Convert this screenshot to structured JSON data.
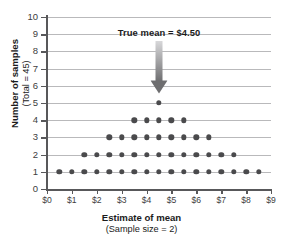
{
  "chart_data": {
    "type": "scatter",
    "title": "",
    "xlabel": "Estimate of mean",
    "xlabel_sub": "(Sample size = 2)",
    "ylabel": "Number of samples",
    "ylabel_sub": "(Total = 45)",
    "xlim": [
      0,
      9
    ],
    "ylim": [
      0,
      10
    ],
    "grid": true,
    "legend": "none",
    "x_tick_labels": [
      "$0",
      "$1",
      "$2",
      "$3",
      "$4",
      "$5",
      "$6",
      "$7",
      "$8",
      "$9"
    ],
    "x_tick_values": [
      0,
      1,
      2,
      3,
      4,
      5,
      6,
      7,
      8,
      9
    ],
    "y_tick_labels": [
      "0",
      "1",
      "2",
      "3",
      "4",
      "5",
      "6",
      "7",
      "8",
      "9",
      "10"
    ],
    "y_tick_values": [
      0,
      1,
      2,
      3,
      4,
      5,
      6,
      7,
      8,
      9,
      10
    ],
    "dot_spacing": 0.5,
    "total_samples": 45,
    "columns": [
      {
        "x": 0.5,
        "count": 1
      },
      {
        "x": 1.0,
        "count": 1
      },
      {
        "x": 1.5,
        "count": 2
      },
      {
        "x": 2.0,
        "count": 2
      },
      {
        "x": 2.5,
        "count": 3
      },
      {
        "x": 3.0,
        "count": 3
      },
      {
        "x": 3.5,
        "count": 4
      },
      {
        "x": 4.0,
        "count": 4
      },
      {
        "x": 4.5,
        "count": 5
      },
      {
        "x": 5.0,
        "count": 4
      },
      {
        "x": 5.5,
        "count": 4
      },
      {
        "x": 6.0,
        "count": 3
      },
      {
        "x": 6.5,
        "count": 3
      },
      {
        "x": 7.0,
        "count": 2
      },
      {
        "x": 7.5,
        "count": 2
      },
      {
        "x": 8.0,
        "count": 1
      },
      {
        "x": 8.5,
        "count": 1
      }
    ],
    "row_extents": [
      {
        "level": 1,
        "from": 0.5,
        "to": 8.5,
        "dots": 17
      },
      {
        "level": 2,
        "from": 1.5,
        "to": 7.5,
        "dots": 13
      },
      {
        "level": 3,
        "from": 2.5,
        "to": 6.5,
        "dots": 9
      },
      {
        "level": 4,
        "from": 3.5,
        "to": 5.5,
        "dots": 5
      },
      {
        "level": 5,
        "from": 4.5,
        "to": 4.5,
        "dots": 1
      }
    ],
    "annotation": {
      "text": "True mean  =  $4.50",
      "x": 4.5,
      "value": 4.5,
      "arrow_from_y": 8.6,
      "arrow_to_y": 5.55,
      "arrow_color_top": "#d8d8da",
      "arrow_color_bottom": "#6e6e70"
    },
    "colors": {
      "dot": "#4a4a4c",
      "grid": "#b9b9bb",
      "axis": "#58585a",
      "text": "#1b1b1b",
      "tick_text": "#404040",
      "background": "#ffffff"
    }
  }
}
